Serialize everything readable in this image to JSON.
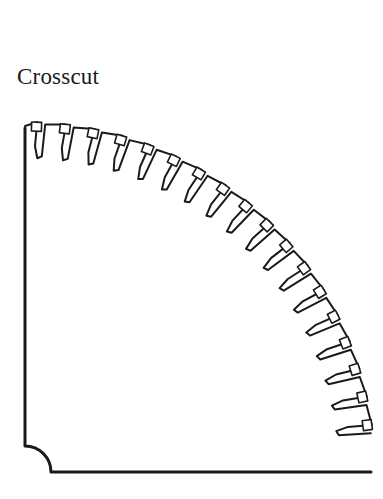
{
  "title": "Crosscut",
  "diagram": {
    "type": "saw-blade-quadrant",
    "stroke_color": "#1a1a1a",
    "center": [
      25,
      472
    ],
    "outer_radius": 350,
    "gullet_radius": 318,
    "tooth_count": 18,
    "start_angle_deg": 88,
    "end_angle_deg": 3,
    "arbor_notch_radius": 26,
    "carbide_tip_size": 10
  }
}
